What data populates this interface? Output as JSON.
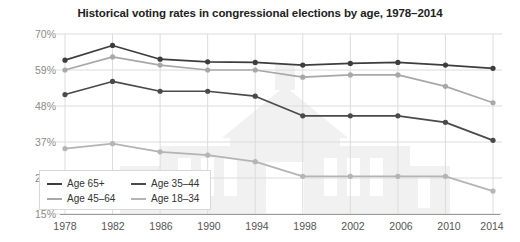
{
  "chart_data": {
    "type": "line",
    "title": "Historical voting rates in congressional elections by age, 1978–2014",
    "xlabel": "",
    "ylabel": "",
    "x": [
      1978,
      1982,
      1986,
      1990,
      1994,
      1998,
      2002,
      2006,
      2010,
      2014
    ],
    "xtick_labels": [
      "1978",
      "1982",
      "1986",
      "1990",
      "1994",
      "1998",
      "2002",
      "2006",
      "2010",
      "2014"
    ],
    "ytick_labels": [
      "15%",
      "26%",
      "37%",
      "48%",
      "59%",
      "70%"
    ],
    "ytick_values": [
      15,
      26,
      37,
      48,
      59,
      70
    ],
    "ylim": [
      15,
      70
    ],
    "grid": true,
    "legend_position": "bottom-left",
    "series": [
      {
        "name": "Age 65+",
        "color": "#3d3d3d",
        "values": [
          62.0,
          66.5,
          62.3,
          61.5,
          61.3,
          60.5,
          61.0,
          61.3,
          60.5,
          59.5
        ]
      },
      {
        "name": "Age 45–64",
        "color": "#a8a8a8",
        "values": [
          59.0,
          63.0,
          60.5,
          59.0,
          59.0,
          56.8,
          57.5,
          57.5,
          54.0,
          49.0
        ]
      },
      {
        "name": "Age 35–44",
        "color": "#4a4a4a",
        "values": [
          51.5,
          55.5,
          52.5,
          52.5,
          51.0,
          45.0,
          45.0,
          45.0,
          43.0,
          37.5
        ]
      },
      {
        "name": "Age 18–34",
        "color": "#b4b4b4",
        "values": [
          35.0,
          36.5,
          34.0,
          33.0,
          31.0,
          26.5,
          26.5,
          26.5,
          26.5,
          22.0
        ]
      }
    ]
  },
  "legend": {
    "entries": [
      {
        "label": "Age 65+",
        "color": "#3d3d3d"
      },
      {
        "label": "Age 35–44",
        "color": "#4a4a4a"
      },
      {
        "label": "Age 45–64",
        "color": "#a8a8a8"
      },
      {
        "label": "Age 18–34",
        "color": "#b4b4b4"
      }
    ]
  },
  "colors": {
    "grid": "#dcdcdc",
    "axis": "#9a9a9a",
    "title": "#222222",
    "ytick": "#8a8a8a",
    "xtick": "#555555",
    "background": "#ffffff",
    "watermark": "#f0f0f0"
  }
}
